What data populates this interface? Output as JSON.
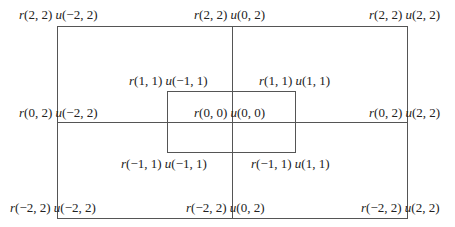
{
  "diagram": {
    "outer_labels": {
      "top_left": {
        "r": "(2, 2)",
        "u": "(−2, 2)"
      },
      "top_center": {
        "r": "(2, 2)",
        "u": "(0, 2)"
      },
      "top_right": {
        "r": "(2, 2)",
        "u": "(2, 2)"
      },
      "middle_left": {
        "r": "(0, 2)",
        "u": "(−2, 2)"
      },
      "middle_right": {
        "r": "(0, 2)",
        "u": "(2, 2)"
      },
      "bottom_left": {
        "r": "(−2, 2)",
        "u": "(−2, 2)"
      },
      "bottom_center": {
        "r": "(−2, 2)",
        "u": "(0, 2)"
      },
      "bottom_right": {
        "r": "(−2, 2)",
        "u": "(2, 2)"
      }
    },
    "inner_labels": {
      "top_left": {
        "r": "(1, 1)",
        "u": "(−1, 1)"
      },
      "top_right": {
        "r": "(1, 1)",
        "u": "(1, 1)"
      },
      "center": {
        "r": "(0, 0)",
        "u": "(0, 0)"
      },
      "bottom_left": {
        "r": "(−1, 1)",
        "u": "(−1, 1)"
      },
      "bottom_right": {
        "r": "(−1, 1)",
        "u": "(1, 1)"
      }
    },
    "symbols": {
      "r": "r",
      "u": "u"
    },
    "line_color": "#555555"
  }
}
